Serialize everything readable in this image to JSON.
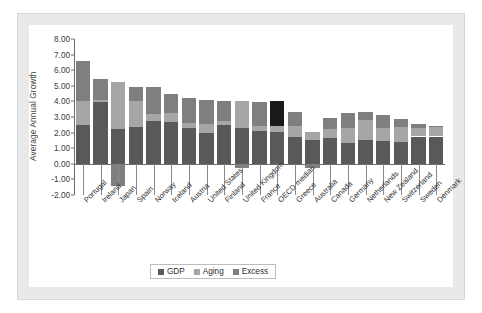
{
  "chart_data": {
    "type": "bar",
    "stacked": true,
    "title": "",
    "subtitle": "",
    "xlabel": "",
    "ylabel": "Average Annual Growth",
    "ylim": [
      -2.0,
      8.0
    ],
    "ytick_step": 1.0,
    "ytick_labels": [
      "8.00",
      "7.00",
      "6.00",
      "5.00",
      "4.00",
      "3.00",
      "2.00",
      "1.00",
      "0.00",
      "-1.00",
      "-2.00"
    ],
    "grid": false,
    "legend_position": "bottom-center",
    "legend": [
      "GDP",
      "Aging",
      "Excess"
    ],
    "colors": {
      "GDP": "#595959",
      "Aging": "#a6a6a6",
      "Excess": "#7f7f7f",
      "Highlight": "#1a1a1a",
      "axis": "#6d6d6d",
      "card": "#ffffff",
      "mat": "#e9e9e9",
      "mat_border": "#d8d8d8",
      "text": "#2e2e2e"
    },
    "highlight_category": "OECD median",
    "categories": [
      "Portugal",
      "Ireland",
      "Japan",
      "Spain",
      "Norway",
      "Iceland",
      "Austria",
      "United States",
      "Finland",
      "United Kingdom",
      "France",
      "OECD median",
      "Greece",
      "Australia",
      "Canada",
      "Germany",
      "Netherlands",
      "New Zealand",
      "Switzerland",
      "Sweden",
      "Denmark"
    ],
    "series": [
      {
        "name": "GDP",
        "values": [
          2.5,
          3.95,
          2.2,
          2.35,
          2.75,
          2.7,
          2.3,
          1.95,
          2.5,
          2.3,
          2.1,
          2.05,
          1.7,
          1.55,
          1.65,
          1.35,
          1.55,
          1.45,
          1.4,
          1.75,
          1.75
        ]
      },
      {
        "name": "Aging",
        "values": [
          1.5,
          0.15,
          3.05,
          1.65,
          0.45,
          0.55,
          0.3,
          0.6,
          0.25,
          1.75,
          0.3,
          0.35,
          0.7,
          0.5,
          0.55,
          0.95,
          1.25,
          0.85,
          0.95,
          0.55,
          0.6
        ]
      },
      {
        "name": "Excess",
        "values": [
          2.6,
          1.35,
          -1.4,
          0.9,
          1.7,
          1.2,
          1.6,
          1.55,
          1.3,
          -0.25,
          1.55,
          1.65,
          0.95,
          -0.3,
          0.75,
          0.95,
          0.5,
          0.85,
          0.55,
          0.25,
          0.1
        ]
      }
    ]
  },
  "legend": {
    "items": [
      {
        "label": "GDP",
        "color": "#595959"
      },
      {
        "label": "Aging",
        "color": "#a6a6a6"
      },
      {
        "label": "Excess",
        "color": "#7f7f7f"
      }
    ]
  },
  "axis": {
    "y_title": "Average Annual Growth"
  }
}
